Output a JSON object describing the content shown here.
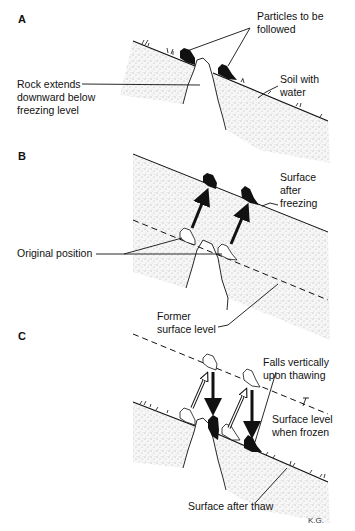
{
  "figure": {
    "panels": [
      {
        "id": "A",
        "letter": "A",
        "labels": {
          "particles": "Particles to be\nfollowed",
          "rock": "Rock extends\ndownward below\nfreezing level",
          "soil": "Soil with\nwater"
        }
      },
      {
        "id": "B",
        "letter": "B",
        "labels": {
          "surface_after_freezing": "Surface\nafter\nfreezing",
          "original_position": "Original position",
          "former_surface": "Former\nsurface level"
        }
      },
      {
        "id": "C",
        "letter": "C",
        "labels": {
          "falls": "Falls vertically\nupon thawing",
          "surface_frozen": "Surface level\nwhen frozen",
          "surface_thaw": "Surface after thaw"
        }
      }
    ],
    "signature": "K.G.",
    "colors": {
      "ink": "#111111",
      "soil_fill": "#f4f4f4",
      "background": "#ffffff"
    }
  }
}
